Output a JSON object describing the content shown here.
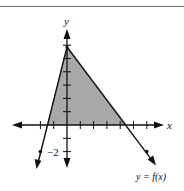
{
  "figure": {
    "x_axis_label": "x",
    "y_axis_label": "y",
    "tick_label": "−2",
    "curve_label": "y = f(x)",
    "colors": {
      "shade": "#a9a9a9",
      "line": "#111111",
      "border": "#6a6a6a"
    }
  },
  "diagram_data": {
    "type": "graph",
    "origin_px": [
      67,
      125
    ],
    "unit_px": 13.3,
    "x_ticks": [
      -2,
      -1,
      1,
      2,
      3,
      4,
      5,
      6
    ],
    "y_ticks": [
      -2,
      -1,
      1,
      2,
      3,
      4,
      5,
      6
    ],
    "lines": [
      {
        "name": "left-line",
        "points": [
          [
            0,
            6
          ],
          [
            -2,
            -2
          ]
        ],
        "slope": 4,
        "x_intercept": -1.5
      },
      {
        "name": "f",
        "label": "y = f(x)",
        "points": [
          [
            0,
            6
          ],
          [
            6,
            -2
          ]
        ],
        "slope": -1.3333,
        "x_intercept": 4.5
      }
    ],
    "shaded_triangle": [
      [
        -1.5,
        0
      ],
      [
        0,
        6
      ],
      [
        4.5,
        0
      ]
    ]
  }
}
